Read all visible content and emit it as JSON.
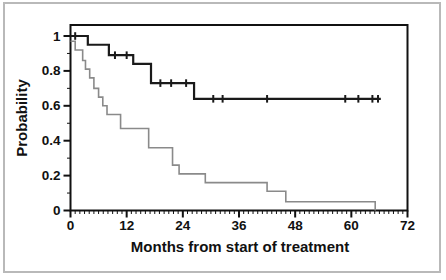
{
  "figure": {
    "background": "#ffffff",
    "border_color": "#b9b9b9"
  },
  "chart_data": {
    "type": "line",
    "subtype": "kaplan-meier-step",
    "title": "",
    "xlabel": "Months from start of treatment",
    "ylabel": "Probability",
    "xlim": [
      0,
      72
    ],
    "ylim": [
      0,
      1.06
    ],
    "grid": "off",
    "legend": "none",
    "x_major_tick_values": [
      0,
      12,
      24,
      36,
      48,
      60,
      72
    ],
    "x_tick_labels": [
      "0",
      "12",
      "24",
      "36",
      "48",
      "60",
      "72"
    ],
    "x_minor_tick_step_months": 1,
    "y_major_tick_values": [
      1,
      0.8,
      0.6,
      0.4,
      0.2,
      0
    ],
    "y_tick_labels": [
      "1",
      "0.8",
      "0.6",
      "0.4",
      "0.2",
      "0"
    ],
    "y_minor_tick_step": 0.1,
    "axis_color": "#111111",
    "series": [
      {
        "name": "upper-group-survival",
        "color": "#1a1a1a",
        "line_width": 2.2,
        "steps_month_probability": [
          [
            0,
            1.0
          ],
          [
            3.7,
            0.95
          ],
          [
            8.2,
            0.89
          ],
          [
            13.4,
            0.84
          ],
          [
            17.2,
            0.73
          ],
          [
            26.4,
            0.64
          ]
        ],
        "end_month": 66.3,
        "censor_tick_months": [
          1.0,
          9.5,
          12.0,
          19.2,
          21.5,
          24.7,
          30.5,
          32.5,
          42.0,
          58.7,
          61.5,
          64.5,
          65.7
        ]
      },
      {
        "name": "lower-group-survival",
        "color": "#8a8a8a",
        "line_width": 1.6,
        "steps_month_probability": [
          [
            0,
            0.97
          ],
          [
            1.0,
            0.92
          ],
          [
            2.6,
            0.86
          ],
          [
            3.2,
            0.81
          ],
          [
            4.1,
            0.76
          ],
          [
            5.0,
            0.7
          ],
          [
            6.0,
            0.65
          ],
          [
            6.9,
            0.6
          ],
          [
            7.8,
            0.55
          ],
          [
            10.7,
            0.47
          ],
          [
            16.7,
            0.36
          ],
          [
            21.8,
            0.26
          ],
          [
            23.2,
            0.21
          ],
          [
            28.8,
            0.16
          ],
          [
            42.0,
            0.11
          ],
          [
            46.0,
            0.05
          ],
          [
            65.1,
            0.0
          ]
        ],
        "end_month": 65.1,
        "censor_tick_months": []
      }
    ]
  }
}
